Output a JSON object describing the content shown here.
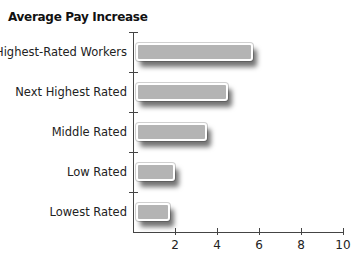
{
  "chart_data": {
    "type": "bar",
    "orientation": "horizontal",
    "title": "Average Pay Increase",
    "categories": [
      "Highest-Rated Workers",
      "Next Highest Rated",
      "Middle Rated",
      "Low Rated",
      "Lowest Rated"
    ],
    "values": [
      5.7,
      4.5,
      3.5,
      2.0,
      1.75
    ],
    "xlabel": "",
    "ylabel": "",
    "xlim": [
      0,
      10
    ],
    "xticks": [
      "2",
      "4",
      "6",
      "8",
      "10"
    ],
    "grid": false,
    "legend": null,
    "bar_color": "#b4b4b4"
  }
}
